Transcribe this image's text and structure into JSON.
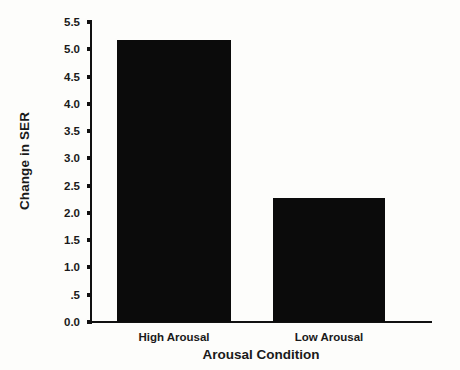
{
  "chart_data": {
    "type": "bar",
    "title": "",
    "xlabel": "Arousal Condition",
    "ylabel": "Change in SER",
    "categories": [
      "High Arousal",
      "Low Arousal"
    ],
    "values": [
      5.17,
      2.27
    ],
    "ylim": [
      0.0,
      5.5
    ],
    "yticks": [
      0.0,
      0.5,
      1.0,
      1.5,
      2.0,
      2.5,
      3.0,
      3.5,
      4.0,
      4.5,
      5.0,
      5.5
    ],
    "ytick_labels": [
      "0.0",
      ".5",
      "1.0",
      "1.5",
      "2.0",
      "2.5",
      "3.0",
      "3.5",
      "4.0",
      "4.5",
      "5.0",
      "5.5"
    ],
    "grid": false,
    "legend": false,
    "bar_color": "#0b0b0b",
    "axis_color": "#111111",
    "background_color": "#fdfdfb"
  }
}
